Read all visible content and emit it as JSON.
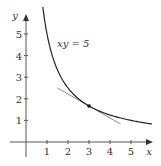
{
  "chart_data": {
    "type": "line",
    "title": "",
    "xlabel": "x",
    "ylabel": "y",
    "xlim": [
      -0.6,
      6.3
    ],
    "ylim": [
      -1.1,
      6.5
    ],
    "x_ticks": [
      "1",
      "2",
      "3",
      "4",
      "5"
    ],
    "y_ticks": [
      "1",
      "2",
      "3",
      "4",
      "5"
    ],
    "grid": false,
    "legend": null,
    "series": [
      {
        "name": "xy = 5",
        "kind": "curve",
        "equation": "y = 5/x",
        "x_range": [
          0.8,
          6.0
        ],
        "color": "#222222"
      },
      {
        "name": "tangent line at (3, 5/3)",
        "kind": "line",
        "slope": -0.5556,
        "x": [
          1.5,
          4.5
        ],
        "y": [
          2.5,
          0.833
        ],
        "color": "#888888"
      }
    ],
    "points": [
      {
        "x": 3,
        "y": 1.667,
        "label": ""
      }
    ],
    "annotations": [
      {
        "text": "xy = 5",
        "x": 1.5,
        "y": 4.6
      }
    ]
  },
  "labels": {
    "x_axis": "x",
    "y_axis": "y",
    "curve_label": "xy = 5",
    "ticks_x": [
      "1",
      "2",
      "3",
      "4",
      "5"
    ],
    "ticks_y": [
      "1",
      "2",
      "3",
      "4",
      "5"
    ]
  }
}
